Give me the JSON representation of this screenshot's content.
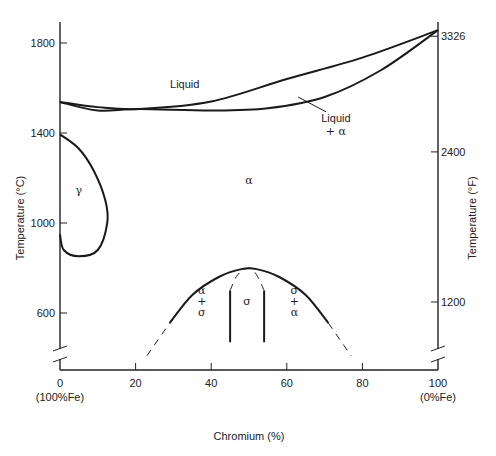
{
  "chart_data": {
    "type": "line",
    "title": "",
    "xlabel": "Chromium (%)",
    "ylabel_left": "Temperature (°C)",
    "ylabel_right": "Temperature (°F)",
    "xlim": [
      0,
      100
    ],
    "ylim_c": [
      440,
      1860
    ],
    "x_ticks": [
      {
        "value": 0,
        "label": "0",
        "sublabel": "(100%Fe)"
      },
      {
        "value": 20,
        "label": "20",
        "sublabel": ""
      },
      {
        "value": 40,
        "label": "40",
        "sublabel": ""
      },
      {
        "value": 60,
        "label": "60",
        "sublabel": ""
      },
      {
        "value": 80,
        "label": "80",
        "sublabel": ""
      },
      {
        "value": 100,
        "label": "100",
        "sublabel": "(0%Fe)"
      }
    ],
    "y_ticks_left": [
      {
        "value": 1800,
        "label": "1800"
      },
      {
        "value": 1400,
        "label": "1400"
      },
      {
        "value": 1000,
        "label": "1000"
      },
      {
        "value": 600,
        "label": "600"
      }
    ],
    "y_ticks_right": [
      {
        "value_f": 3326,
        "value_c": 1830,
        "label": "3326"
      },
      {
        "value_f": 2400,
        "value_c": 1316,
        "label": "2400"
      },
      {
        "value_f": 1200,
        "value_c": 649,
        "label": "1200"
      }
    ],
    "series": [
      {
        "name": "Liquidus",
        "style": "solid",
        "points": [
          [
            0,
            1538
          ],
          [
            10,
            1515
          ],
          [
            21,
            1507
          ],
          [
            40,
            1540
          ],
          [
            60,
            1640
          ],
          [
            80,
            1735
          ],
          [
            100,
            1857
          ]
        ]
      },
      {
        "name": "Solidus",
        "style": "solid",
        "points": [
          [
            0,
            1538
          ],
          [
            10,
            1500
          ],
          [
            21,
            1507
          ],
          [
            40,
            1500
          ],
          [
            55,
            1510
          ],
          [
            70,
            1560
          ],
          [
            85,
            1680
          ],
          [
            100,
            1857
          ]
        ]
      },
      {
        "name": "Gamma loop",
        "style": "solid",
        "points": [
          [
            0,
            1394
          ],
          [
            5,
            1330
          ],
          [
            9,
            1230
          ],
          [
            12,
            1100
          ],
          [
            12.5,
            1000
          ],
          [
            10,
            880
          ],
          [
            5,
            852
          ],
          [
            1,
            880
          ],
          [
            0,
            950
          ]
        ]
      },
      {
        "name": "Sigma solvus",
        "style": "solid",
        "points": [
          [
            29,
            555
          ],
          [
            35,
            680
          ],
          [
            42,
            760
          ],
          [
            48,
            795
          ],
          [
            52,
            795
          ],
          [
            58,
            760
          ],
          [
            65,
            680
          ],
          [
            71,
            555
          ]
        ]
      },
      {
        "name": "Sigma solvus (extrapolated left)",
        "style": "dashed",
        "points": [
          [
            23,
            410
          ],
          [
            29,
            555
          ]
        ]
      },
      {
        "name": "Sigma solvus (extrapolated right)",
        "style": "dashed",
        "points": [
          [
            71,
            555
          ],
          [
            77,
            410
          ]
        ]
      },
      {
        "name": "Sigma boundary left",
        "style": "solid",
        "points": [
          [
            45,
            700
          ],
          [
            45,
            470
          ]
        ]
      },
      {
        "name": "Sigma boundary right",
        "style": "solid",
        "points": [
          [
            54,
            700
          ],
          [
            54,
            470
          ]
        ]
      },
      {
        "name": "Sigma phase dome",
        "style": "dashed",
        "points": [
          [
            45,
            700
          ],
          [
            47,
            770
          ],
          [
            50,
            800
          ],
          [
            52,
            770
          ],
          [
            54,
            700
          ]
        ]
      }
    ],
    "annotations": [
      {
        "text": "Liquid",
        "x": 33,
        "y": 1600
      },
      {
        "text": "Liquid",
        "x": 73,
        "y": 1450,
        "leader_to": [
          63,
          1560
        ]
      },
      {
        "text": "+ α",
        "x": 73,
        "y": 1390
      },
      {
        "text": "α",
        "x": 50,
        "y": 1175
      },
      {
        "text": "γ",
        "x": 5,
        "y": 1130
      },
      {
        "text": "α",
        "x": 37.5,
        "y": 685
      },
      {
        "text": "+",
        "x": 37.5,
        "y": 635
      },
      {
        "text": "σ",
        "x": 37.5,
        "y": 585
      },
      {
        "text": "σ",
        "x": 49.5,
        "y": 635
      },
      {
        "text": "σ",
        "x": 62,
        "y": 685
      },
      {
        "text": "+",
        "x": 62,
        "y": 635
      },
      {
        "text": "α",
        "x": 62,
        "y": 585
      }
    ],
    "axis_breaks": true,
    "grid": false,
    "legend": "none"
  }
}
